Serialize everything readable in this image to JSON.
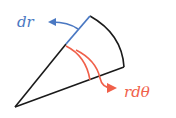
{
  "diagram": {
    "type": "polar-area-element",
    "labels": {
      "radial": "dr",
      "angular": "rdθ"
    },
    "colors": {
      "outline": "#1a1a1a",
      "radial": "#4a78c2",
      "angular": "#f0604a",
      "background": "#ffffff"
    }
  }
}
